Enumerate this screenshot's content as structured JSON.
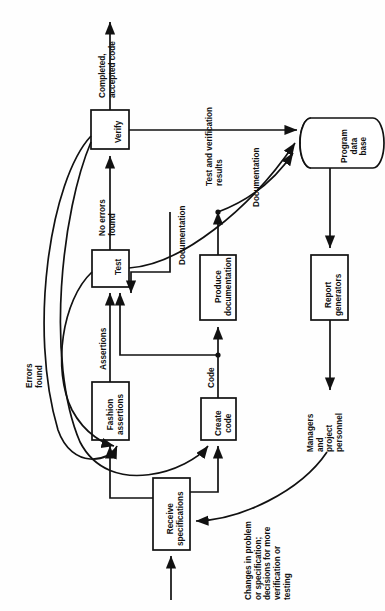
{
  "diagram": {
    "orientation_degrees": -90,
    "type": "flowchart",
    "stroke_color": "#111111",
    "fill_color": "#ffffff",
    "nodes": [
      {
        "id": "verify",
        "shape": "process",
        "label": "Verify"
      },
      {
        "id": "test",
        "shape": "process",
        "label": "Test"
      },
      {
        "id": "fashion",
        "shape": "process",
        "label": "Fashion\nassertions"
      },
      {
        "id": "create",
        "shape": "process",
        "label": "Create\ncode"
      },
      {
        "id": "produce",
        "shape": "process",
        "label": "Produce\ndocumentation"
      },
      {
        "id": "receive",
        "shape": "process",
        "label": "Receive\nspecifications"
      },
      {
        "id": "report",
        "shape": "process",
        "label": "Report\ngenerators"
      },
      {
        "id": "database",
        "shape": "cylinder",
        "label": "Program\ndata\nbase"
      }
    ],
    "edge_labels": [
      {
        "id": "completed",
        "text": "Completed,\naccepted code"
      },
      {
        "id": "testverif",
        "text": "Test and verification\nresults"
      },
      {
        "id": "noerrors",
        "text": "No errors\nfound"
      },
      {
        "id": "documentation1",
        "text": "Documentation"
      },
      {
        "id": "documentation2",
        "text": "Documentation"
      },
      {
        "id": "errorsfound",
        "text": "Errors\nfound"
      },
      {
        "id": "assertions",
        "text": "Assertions"
      },
      {
        "id": "code",
        "text": "Code"
      },
      {
        "id": "managers",
        "text": "Managers\nand\nproject\npersonnel"
      },
      {
        "id": "changes",
        "text": "Changes in problem\nor specification;\ndecisions for more\nverification or\ntesting"
      }
    ]
  }
}
